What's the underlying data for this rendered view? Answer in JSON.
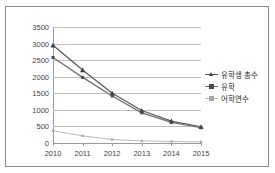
{
  "figure": {
    "top_cut_text": "· ··· ·· ···",
    "background": "#ffffff",
    "border_color": "#8c8c8c"
  },
  "chart_data": {
    "type": "line",
    "title": "",
    "subtitle": "",
    "xlabel": "",
    "ylabel": "",
    "categories": [
      "2010",
      "2011",
      "2012",
      "2013",
      "2014",
      "2015"
    ],
    "x": [
      2010,
      2011,
      2012,
      2013,
      2014,
      2015
    ],
    "ylim": [
      0,
      3500
    ],
    "yticks": [
      0,
      500,
      1000,
      1500,
      2000,
      2500,
      3000,
      3500
    ],
    "ytick_labels": [
      "0",
      "500",
      "1000",
      "1500",
      "2000",
      "2500",
      "3000",
      "3500"
    ],
    "grid": true,
    "grid_axis": "y",
    "legend_position": "right",
    "series": [
      {
        "name": "유학생 총수",
        "values": [
          2950,
          2200,
          1500,
          980,
          660,
          490
        ],
        "color": "#595959",
        "marker": "triangle",
        "marker_color": "#404040"
      },
      {
        "name": "유학",
        "values": [
          2580,
          1980,
          1420,
          910,
          620,
          460
        ],
        "color": "#6e6e6e",
        "marker": "square",
        "marker_color": "#4a4a4a"
      },
      {
        "name": "어학연수",
        "values": [
          370,
          215,
          105,
          65,
          45,
          35
        ],
        "color": "#b3b3b3",
        "marker": "square",
        "marker_color": "#a6a6a6"
      }
    ]
  }
}
